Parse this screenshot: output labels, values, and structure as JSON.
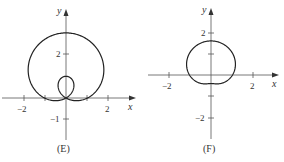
{
  "panels": [
    {
      "id": "E",
      "caption": "(E)",
      "x_label": "x",
      "y_label": "y",
      "x_ticks": [
        {
          "value": -2,
          "label": "−2"
        },
        {
          "value": -1,
          "label": ""
        },
        {
          "value": 1,
          "label": ""
        },
        {
          "value": 2,
          "label": "2"
        }
      ],
      "y_ticks": [
        {
          "value": 2,
          "label": "2"
        },
        {
          "value": -1,
          "label": "−1"
        }
      ],
      "curve": "r = 1 + 2 sinθ (limacon with inner loop)"
    },
    {
      "id": "F",
      "caption": "(F)",
      "x_label": "x",
      "y_label": "y",
      "x_ticks": [
        {
          "value": -2,
          "label": "−2"
        },
        {
          "value": 2,
          "label": "2"
        }
      ],
      "y_ticks": [
        {
          "value": 2,
          "label": "2"
        },
        {
          "value": 1,
          "label": ""
        },
        {
          "value": -1,
          "label": ""
        },
        {
          "value": -2,
          "label": "−2"
        }
      ],
      "curve": "r = 1 + 0.6 sinθ (dimpled limacon)"
    }
  ],
  "colors": {
    "axis": "#555555",
    "curve": "#222222"
  }
}
